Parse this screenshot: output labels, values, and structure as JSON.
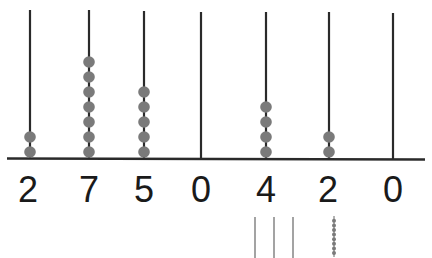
{
  "diagram": {
    "type": "abacus",
    "rods": [
      {
        "position": 1,
        "beads": 2,
        "digit": "2"
      },
      {
        "position": 2,
        "beads": 7,
        "digit": "7"
      },
      {
        "position": 3,
        "beads": 5,
        "digit": "5"
      },
      {
        "position": 4,
        "beads": 0,
        "digit": "0"
      },
      {
        "position": 5,
        "beads": 4,
        "digit": "4"
      },
      {
        "position": 6,
        "beads": 2,
        "digit": "2"
      },
      {
        "position": 7,
        "beads": 0,
        "digit": "0"
      }
    ],
    "number_shown": "2750420",
    "extra_markings": {
      "tally_lines": 3,
      "small_bead_stack": 8
    },
    "colors": {
      "rod": "#2a2a2a",
      "bead": "#7a7a7a",
      "digit": "#1a1a1a",
      "background": "#ffffff"
    }
  }
}
